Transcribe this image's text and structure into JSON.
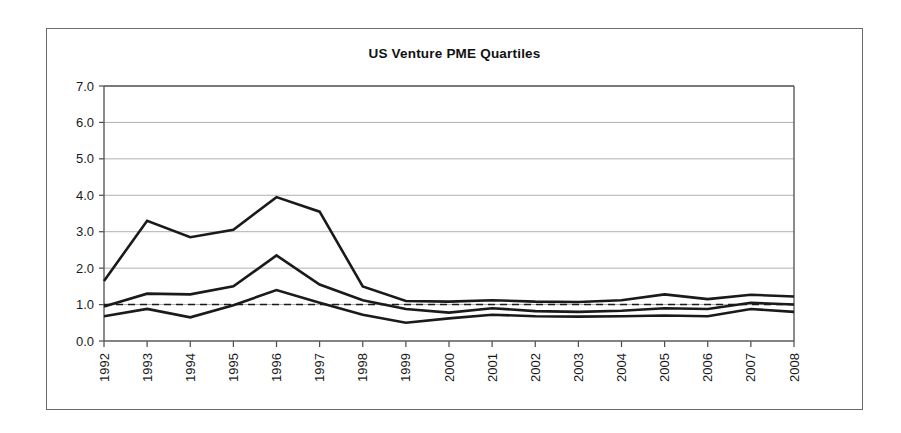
{
  "chart_data": {
    "type": "line",
    "title": "US Venture PME Quartiles",
    "xlabel": "",
    "ylabel": "",
    "ylim": [
      0.0,
      7.0
    ],
    "ytick_labels": [
      "0.0",
      "1.0",
      "2.0",
      "3.0",
      "4.0",
      "5.0",
      "6.0",
      "7.0"
    ],
    "ytick_values": [
      0.0,
      1.0,
      2.0,
      3.0,
      4.0,
      5.0,
      6.0,
      7.0
    ],
    "grid": true,
    "legend": "none",
    "categories": [
      "1992",
      "1993",
      "1994",
      "1995",
      "1996",
      "1997",
      "1998",
      "1999",
      "2000",
      "2001",
      "2002",
      "2003",
      "2004",
      "2005",
      "2006",
      "2007",
      "2008"
    ],
    "x": [
      1992,
      1993,
      1994,
      1995,
      1996,
      1997,
      1998,
      1999,
      2000,
      2001,
      2002,
      2003,
      2004,
      2005,
      2006,
      2007,
      2008
    ],
    "series": [
      {
        "name": "Top quartile",
        "values": [
          1.65,
          3.3,
          2.85,
          3.05,
          3.95,
          3.55,
          1.5,
          1.1,
          1.08,
          1.12,
          1.08,
          1.07,
          1.12,
          1.28,
          1.15,
          1.27,
          1.22
        ]
      },
      {
        "name": "Median",
        "values": [
          0.95,
          1.3,
          1.28,
          1.5,
          2.35,
          1.55,
          1.12,
          0.88,
          0.78,
          0.9,
          0.82,
          0.8,
          0.83,
          0.9,
          0.88,
          1.05,
          1.0
        ]
      },
      {
        "name": "Bottom quartile",
        "values": [
          0.68,
          0.88,
          0.65,
          0.98,
          1.4,
          1.05,
          0.72,
          0.5,
          0.62,
          0.72,
          0.68,
          0.67,
          0.68,
          0.7,
          0.68,
          0.88,
          0.8
        ]
      }
    ],
    "annotations": [
      {
        "name": "reference-line",
        "type": "hline",
        "value": 1.0,
        "style": "dashed"
      }
    ]
  },
  "colors": {
    "line": "#1a1a1a",
    "grid": "#9a9a9a",
    "axis": "#5a5a5a",
    "frame": "#6b6b6b",
    "background": "#ffffff"
  }
}
